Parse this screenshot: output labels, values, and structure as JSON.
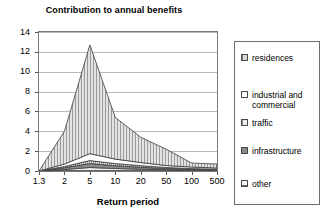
{
  "chart_data": {
    "type": "area",
    "stacked": true,
    "title": "Contribution to annual benefits",
    "xlabel": "Return period",
    "ylabel": "",
    "categories": [
      "1.3",
      "2",
      "5",
      "10",
      "20",
      "50",
      "100",
      "500"
    ],
    "yticks": [
      0,
      2,
      4,
      6,
      8,
      10,
      12,
      14
    ],
    "ylim": [
      0,
      14
    ],
    "grid": true,
    "legend_position": "right",
    "series": [
      {
        "name": "other",
        "values": [
          0.0,
          0.15,
          0.35,
          0.25,
          0.18,
          0.12,
          0.08,
          0.06
        ]
      },
      {
        "name": "infrastructure",
        "values": [
          0.0,
          0.18,
          0.4,
          0.28,
          0.2,
          0.13,
          0.09,
          0.07
        ]
      },
      {
        "name": "traffic",
        "values": [
          0.0,
          0.12,
          0.3,
          0.22,
          0.16,
          0.1,
          0.07,
          0.05
        ]
      },
      {
        "name": "industrial and commercial",
        "values": [
          0.0,
          0.25,
          0.7,
          0.45,
          0.31,
          0.2,
          0.16,
          0.12
        ]
      },
      {
        "name": "residences",
        "values": [
          0.0,
          3.3,
          10.95,
          4.2,
          2.55,
          1.65,
          0.4,
          0.4
        ]
      }
    ],
    "totals": [
      0.0,
      4.0,
      12.7,
      5.4,
      3.4,
      2.2,
      0.8,
      0.7
    ]
  },
  "chart": {
    "title": "Contribution to annual benefits",
    "xaxis_title": "Return period"
  },
  "legend": {
    "items": [
      {
        "label": "residences",
        "swatch": "residences-swatch"
      },
      {
        "label": "industrial and\ncommercial",
        "swatch": "industrial-swatch"
      },
      {
        "label": "traffic",
        "swatch": "traffic-swatch"
      },
      {
        "label": "infrastructure",
        "swatch": "infrastructure-swatch"
      },
      {
        "label": "other",
        "swatch": "other-swatch"
      }
    ]
  },
  "colors": {
    "frame": "#7a7a7a",
    "gridline": "#b9b9b9",
    "residences_fill": "#d9d9d9",
    "infrastructure_fill": "#8a8a8a",
    "outline": "#3c3c3c"
  }
}
